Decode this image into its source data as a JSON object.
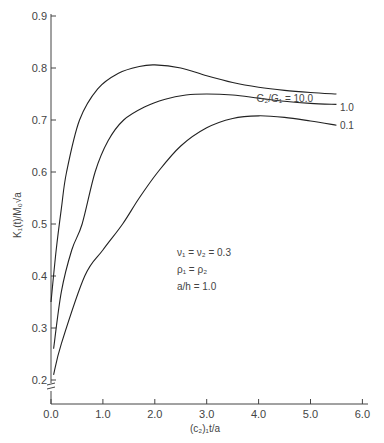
{
  "chart_data": {
    "type": "line",
    "title": "",
    "xlabel": "(c₂)₁t/a",
    "ylabel": "K₁(t)/M₀√a",
    "xlim": [
      0,
      6
    ],
    "ylim": [
      0.2,
      0.9
    ],
    "y_axis_break": true,
    "grid": false,
    "x_ticks": [
      "0.0",
      "1.0",
      "2.0",
      "3.0",
      "4.0",
      "5.0",
      "6.0"
    ],
    "y_ticks": [
      "0.2",
      "0.3",
      "0.4",
      "0.5",
      "0.6",
      "0.7",
      "0.8",
      "0.9"
    ],
    "legend_title": "G₂/G₁ =",
    "series": [
      {
        "name": "10.0",
        "label": "G₂/G₁ = 10.0",
        "points": [
          [
            0.0,
            0.35
          ],
          [
            0.1,
            0.45
          ],
          [
            0.2,
            0.53
          ],
          [
            0.3,
            0.6
          ],
          [
            0.55,
            0.7
          ],
          [
            0.9,
            0.76
          ],
          [
            1.3,
            0.79
          ],
          [
            1.7,
            0.803
          ],
          [
            2.0,
            0.806
          ],
          [
            2.5,
            0.8
          ],
          [
            3.0,
            0.785
          ],
          [
            3.5,
            0.772
          ],
          [
            4.0,
            0.763
          ],
          [
            4.5,
            0.757
          ],
          [
            5.0,
            0.753
          ],
          [
            5.5,
            0.75
          ]
        ]
      },
      {
        "name": "1.0",
        "label": "1.0",
        "points": [
          [
            0.05,
            0.26
          ],
          [
            0.2,
            0.37
          ],
          [
            0.4,
            0.45
          ],
          [
            0.6,
            0.5
          ],
          [
            0.85,
            0.6
          ],
          [
            1.1,
            0.66
          ],
          [
            1.4,
            0.7
          ],
          [
            1.8,
            0.725
          ],
          [
            2.2,
            0.74
          ],
          [
            2.6,
            0.748
          ],
          [
            3.0,
            0.75
          ],
          [
            3.5,
            0.748
          ],
          [
            4.0,
            0.742
          ],
          [
            4.5,
            0.736
          ],
          [
            5.0,
            0.732
          ],
          [
            5.5,
            0.73
          ]
        ]
      },
      {
        "name": "0.1",
        "label": "0.1",
        "points": [
          [
            0.05,
            0.21
          ],
          [
            0.2,
            0.27
          ],
          [
            0.65,
            0.4
          ],
          [
            1.0,
            0.45
          ],
          [
            1.38,
            0.5
          ],
          [
            1.7,
            0.55
          ],
          [
            2.06,
            0.6
          ],
          [
            2.5,
            0.65
          ],
          [
            3.0,
            0.685
          ],
          [
            3.5,
            0.703
          ],
          [
            4.0,
            0.708
          ],
          [
            4.5,
            0.705
          ],
          [
            5.0,
            0.698
          ],
          [
            5.5,
            0.69
          ]
        ]
      }
    ],
    "annotations": [
      "ν₁ = ν₂ = 0.3",
      "ρ₁ = ρ₂",
      "a/h = 1.0"
    ]
  },
  "labels": {
    "series_10": "G₂/G₁ = 10.0",
    "series_1": "1.0",
    "series_01": "0.1",
    "xlabel": "(c₂)₁t/a",
    "ylabel": "K₁(t)/M₀√a",
    "note1": "ν₁ = ν₂ = 0.3",
    "note2": "ρ₁ = ρ₂",
    "note3": "a/h = 1.0"
  }
}
